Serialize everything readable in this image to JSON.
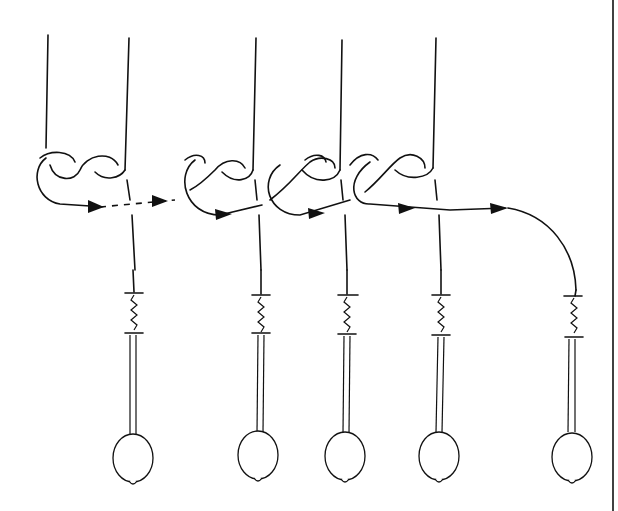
{
  "diagram": {
    "colors": {
      "ink": "#111111",
      "background": "#ffffff"
    },
    "bobbin_count": 5,
    "arrow_count": 6,
    "border": "right-edge"
  }
}
